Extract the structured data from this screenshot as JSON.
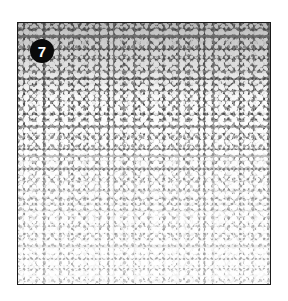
{
  "figure": {
    "panel_label": "7",
    "colors": {
      "border": "#1a1a1a",
      "badge_bg": "#0a0a0a",
      "badge_text": "#ffffff",
      "page_bg": "#ffffff"
    }
  }
}
